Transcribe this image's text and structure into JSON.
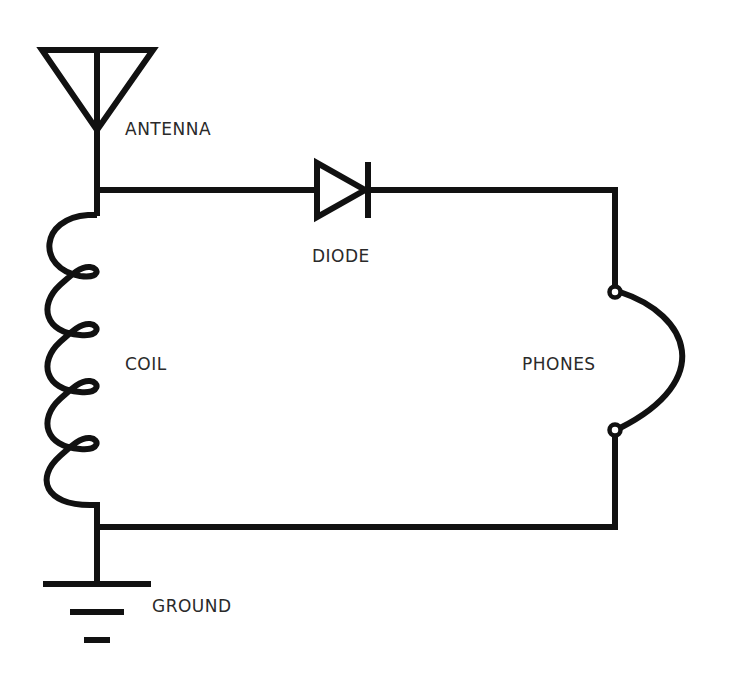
{
  "diagram": {
    "stroke_color": "#111111",
    "label_color": "#2a2a2a",
    "components": [
      {
        "id": "antenna",
        "label": "ANTENNA"
      },
      {
        "id": "diode",
        "label": "DIODE"
      },
      {
        "id": "coil",
        "label": "COIL"
      },
      {
        "id": "phones",
        "label": "PHONES"
      },
      {
        "id": "ground",
        "label": "GROUND"
      }
    ],
    "connections": [
      [
        "antenna",
        "coil"
      ],
      [
        "antenna",
        "diode"
      ],
      [
        "diode",
        "phones"
      ],
      [
        "phones",
        "ground"
      ],
      [
        "coil",
        "ground"
      ]
    ]
  },
  "labels": {
    "antenna": "ANTENNA",
    "diode": "DIODE",
    "coil": "COIL",
    "phones": "PHONES",
    "ground": "GROUND"
  }
}
